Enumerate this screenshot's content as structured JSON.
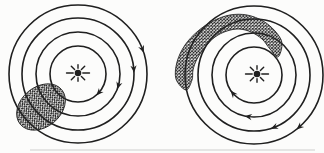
{
  "canvas": {
    "width": 324,
    "height": 153,
    "background": "#fcfcfb"
  },
  "style": {
    "line_color": "#1f1f1f",
    "line_width": 1.6,
    "hatch_color": "#262626",
    "hatch_cell": 3.2,
    "hatch_line_width": 0.95,
    "arrow_length": 7.4,
    "arrow_half_width": 3.1,
    "artifact_color": "#c4c4c4",
    "artifact_opacity": 0.4
  },
  "panels": [
    {
      "id": "left",
      "center": {
        "x": 78,
        "y": 74
      },
      "orbit_radii": [
        28,
        42,
        56,
        69
      ],
      "star": {
        "x": 78,
        "y": 73,
        "dot_radius": 3.3,
        "ray_inner": 4.8,
        "ray_width": 1.4,
        "ray_outer_horizontal": 11.5,
        "ray_outer_diagonal": 9.5,
        "ray_outer_vertical": 8.2
      },
      "arrows": [
        {
          "radius": 69,
          "angle_deg": -21
        },
        {
          "radius": 56,
          "angle_deg": -5
        },
        {
          "radius": 42,
          "angle_deg": 16
        },
        {
          "radius": 28,
          "angle_deg": 42
        }
      ],
      "cloud": {
        "shape": "ellipse",
        "cx": 41,
        "cy": 107,
        "rx": 27,
        "ry": 20,
        "rotation_deg": -40
      }
    },
    {
      "id": "right",
      "center": {
        "x": 254,
        "y": 75
      },
      "orbit_radii": [
        28,
        42,
        56,
        69
      ],
      "star": {
        "x": 257,
        "y": 74,
        "dot_radius": 3.3,
        "ray_inner": 4.8,
        "ray_width": 1.4,
        "ray_outer_horizontal": 11.5,
        "ray_outer_diagonal": 9.5,
        "ray_outer_vertical": 8.2
      },
      "arrows": [
        {
          "radius": 69,
          "angle_deg": 49
        },
        {
          "radius": 56,
          "angle_deg": 69
        },
        {
          "radius": 42,
          "angle_deg": 98
        },
        {
          "radius": 28,
          "angle_deg": 139
        }
      ],
      "cloud": {
        "shape": "band",
        "points": [
          [
            186,
            90
          ],
          [
            176,
            79
          ],
          [
            177,
            62
          ],
          [
            185,
            45
          ],
          [
            198,
            31
          ],
          [
            213,
            21
          ],
          [
            230,
            15
          ],
          [
            247,
            15
          ],
          [
            263,
            21
          ],
          [
            275,
            31
          ],
          [
            282,
            43
          ],
          [
            278,
            57
          ],
          [
            270,
            49
          ],
          [
            262,
            39
          ],
          [
            251,
            32
          ],
          [
            239,
            29
          ],
          [
            227,
            31
          ],
          [
            215,
            37
          ],
          [
            205,
            47
          ],
          [
            197,
            59
          ],
          [
            193,
            70
          ],
          [
            192,
            80
          ]
        ]
      }
    }
  ],
  "artifact": {
    "x": 30,
    "y": 149,
    "width": 285,
    "height": 2
  }
}
